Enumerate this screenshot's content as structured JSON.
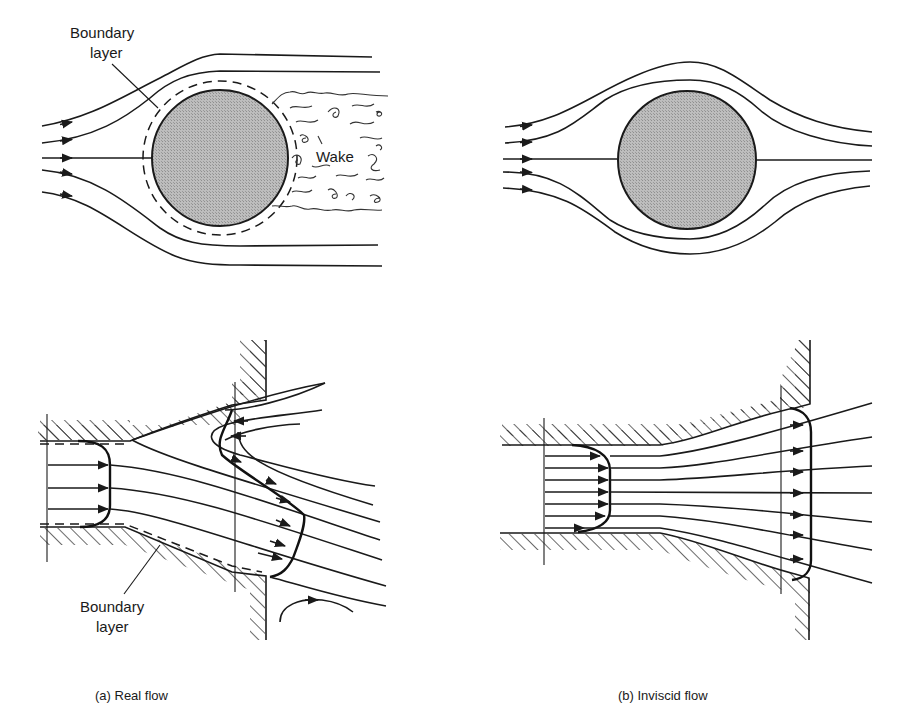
{
  "figure": {
    "panels": [
      {
        "id": "a",
        "caption": "(a)  Real flow",
        "top_labels": {
          "boundary_layer": [
            "Boundary",
            "layer"
          ],
          "wake": "Wake"
        },
        "bottom_labels": {
          "boundary_layer": [
            "Boundary",
            "layer"
          ]
        }
      },
      {
        "id": "b",
        "caption": "(b)  Inviscid flow"
      }
    ],
    "colors": {
      "ink": "#1a1a1a",
      "body_fill": "#b3b3b3",
      "background": "#ffffff"
    }
  }
}
